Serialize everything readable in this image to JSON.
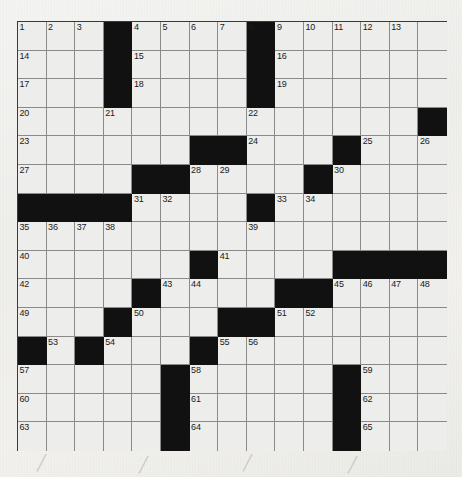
{
  "puzzle": {
    "title": "Crossword Grid",
    "rows": 15,
    "cols": 15,
    "cell_size": 28.6,
    "colors": {
      "paper": "#f1f1ee",
      "cell_fill": "#ededeb",
      "block_fill": "#111111",
      "grid_line": "#8a8a8a",
      "border": "#3a3a3a",
      "number_text": "#1b1b1b"
    },
    "blocks": [
      [
        0,
        3
      ],
      [
        0,
        8
      ],
      [
        1,
        3
      ],
      [
        1,
        8
      ],
      [
        2,
        3
      ],
      [
        2,
        8
      ],
      [
        3,
        14
      ],
      [
        4,
        6
      ],
      [
        4,
        7
      ],
      [
        4,
        11
      ],
      [
        5,
        4
      ],
      [
        5,
        5
      ],
      [
        5,
        10
      ],
      [
        6,
        0
      ],
      [
        6,
        1
      ],
      [
        6,
        2
      ],
      [
        6,
        3
      ],
      [
        6,
        8
      ],
      [
        8,
        6
      ],
      [
        8,
        11
      ],
      [
        8,
        12
      ],
      [
        8,
        13
      ],
      [
        8,
        14
      ],
      [
        9,
        4
      ],
      [
        9,
        9
      ],
      [
        9,
        10
      ],
      [
        10,
        3
      ],
      [
        10,
        7
      ],
      [
        10,
        8
      ],
      [
        11,
        0
      ],
      [
        11,
        2
      ],
      [
        11,
        6
      ],
      [
        12,
        5
      ],
      [
        12,
        11
      ],
      [
        13,
        5
      ],
      [
        13,
        11
      ],
      [
        14,
        5
      ],
      [
        14,
        11
      ]
    ],
    "numbers": [
      {
        "r": 0,
        "c": 0,
        "n": "1"
      },
      {
        "r": 0,
        "c": 1,
        "n": "2"
      },
      {
        "r": 0,
        "c": 2,
        "n": "3"
      },
      {
        "r": 0,
        "c": 4,
        "n": "4"
      },
      {
        "r": 0,
        "c": 5,
        "n": "5"
      },
      {
        "r": 0,
        "c": 6,
        "n": "6"
      },
      {
        "r": 0,
        "c": 7,
        "n": "7"
      },
      {
        "r": 0,
        "c": 8,
        "n": "8"
      },
      {
        "r": 0,
        "c": 9,
        "n": "9"
      },
      {
        "r": 0,
        "c": 10,
        "n": "10"
      },
      {
        "r": 0,
        "c": 11,
        "n": "11"
      },
      {
        "r": 0,
        "c": 12,
        "n": "12"
      },
      {
        "r": 0,
        "c": 13,
        "n": "13"
      },
      {
        "r": 1,
        "c": 0,
        "n": "14"
      },
      {
        "r": 1,
        "c": 4,
        "n": "15"
      },
      {
        "r": 1,
        "c": 9,
        "n": "16"
      },
      {
        "r": 2,
        "c": 0,
        "n": "17"
      },
      {
        "r": 2,
        "c": 4,
        "n": "18"
      },
      {
        "r": 2,
        "c": 9,
        "n": "19"
      },
      {
        "r": 3,
        "c": 0,
        "n": "20"
      },
      {
        "r": 3,
        "c": 3,
        "n": "21"
      },
      {
        "r": 3,
        "c": 8,
        "n": "22"
      },
      {
        "r": 4,
        "c": 0,
        "n": "23"
      },
      {
        "r": 4,
        "c": 8,
        "n": "24"
      },
      {
        "r": 4,
        "c": 12,
        "n": "25"
      },
      {
        "r": 4,
        "c": 14,
        "n": "26"
      },
      {
        "r": 5,
        "c": 0,
        "n": "27"
      },
      {
        "r": 5,
        "c": 6,
        "n": "28"
      },
      {
        "r": 5,
        "c": 7,
        "n": "29"
      },
      {
        "r": 5,
        "c": 11,
        "n": "30"
      },
      {
        "r": 6,
        "c": 4,
        "n": "31"
      },
      {
        "r": 6,
        "c": 5,
        "n": "32"
      },
      {
        "r": 6,
        "c": 9,
        "n": "33"
      },
      {
        "r": 6,
        "c": 10,
        "n": "34"
      },
      {
        "r": 7,
        "c": 0,
        "n": "35"
      },
      {
        "r": 7,
        "c": 1,
        "n": "36"
      },
      {
        "r": 7,
        "c": 2,
        "n": "37"
      },
      {
        "r": 7,
        "c": 3,
        "n": "38"
      },
      {
        "r": 7,
        "c": 8,
        "n": "39"
      },
      {
        "r": 8,
        "c": 0,
        "n": "40"
      },
      {
        "r": 8,
        "c": 7,
        "n": "41"
      },
      {
        "r": 9,
        "c": 0,
        "n": "42"
      },
      {
        "r": 9,
        "c": 5,
        "n": "43"
      },
      {
        "r": 9,
        "c": 6,
        "n": "44"
      },
      {
        "r": 9,
        "c": 11,
        "n": "45"
      },
      {
        "r": 9,
        "c": 12,
        "n": "46"
      },
      {
        "r": 9,
        "c": 13,
        "n": "47"
      },
      {
        "r": 9,
        "c": 14,
        "n": "48"
      },
      {
        "r": 10,
        "c": 0,
        "n": "49"
      },
      {
        "r": 10,
        "c": 4,
        "n": "50"
      },
      {
        "r": 10,
        "c": 9,
        "n": "51"
      },
      {
        "r": 10,
        "c": 10,
        "n": "52"
      },
      {
        "r": 11,
        "c": 1,
        "n": "53"
      },
      {
        "r": 11,
        "c": 3,
        "n": "54"
      },
      {
        "r": 11,
        "c": 7,
        "n": "55"
      },
      {
        "r": 11,
        "c": 8,
        "n": "56"
      },
      {
        "r": 12,
        "c": 0,
        "n": "57"
      },
      {
        "r": 12,
        "c": 6,
        "n": "58"
      },
      {
        "r": 12,
        "c": 12,
        "n": "59"
      },
      {
        "r": 13,
        "c": 0,
        "n": "60"
      },
      {
        "r": 13,
        "c": 6,
        "n": "61"
      },
      {
        "r": 13,
        "c": 12,
        "n": "62"
      },
      {
        "r": 14,
        "c": 0,
        "n": "63"
      },
      {
        "r": 14,
        "c": 6,
        "n": "64"
      },
      {
        "r": 14,
        "c": 12,
        "n": "65"
      }
    ],
    "scratch_marks": [
      {
        "x": 37,
        "y": 456,
        "glyph": "╱"
      },
      {
        "x": 139,
        "y": 458,
        "glyph": "╱"
      },
      {
        "x": 243,
        "y": 456,
        "glyph": "╱"
      },
      {
        "x": 348,
        "y": 458,
        "glyph": "╱"
      }
    ]
  }
}
